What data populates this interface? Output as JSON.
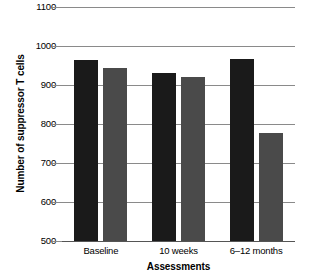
{
  "chart_data": {
    "type": "bar",
    "title": "",
    "xlabel": "Assessments",
    "ylabel": "Number of suppressor T cells",
    "categories": [
      "Baseline",
      "10 weeks",
      "6–12 months"
    ],
    "series": [
      {
        "name": "series-1",
        "color": "#1a1a1a",
        "values": [
          965,
          932,
          967
        ]
      },
      {
        "name": "series-2",
        "color": "#4a4a4a",
        "values": [
          943,
          920,
          777
        ]
      }
    ],
    "ylim": [
      500,
      1100
    ],
    "ytick_labels": [
      "1100",
      "1000",
      "900",
      "800",
      "700",
      "600",
      "500"
    ],
    "ytick_values": [
      1100,
      1000,
      900,
      800,
      700,
      600,
      500
    ],
    "grid": true,
    "grid_color": "#8a8a8a",
    "legend": "none",
    "legend_position": "none"
  },
  "axes": {
    "y_title": "Number of suppressor T cells",
    "x_title": "Assessments"
  }
}
